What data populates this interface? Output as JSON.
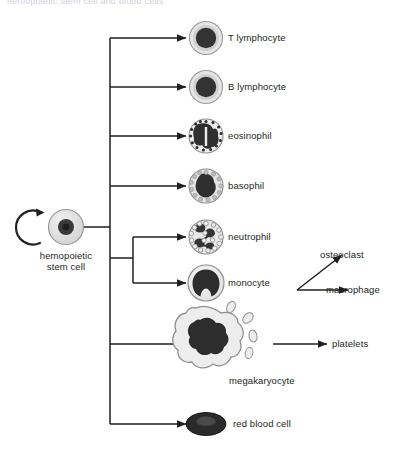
{
  "figure": {
    "clipped_header": "hemopoietic stem cell and blood cells",
    "root": {
      "label_line1": "hemopoietic",
      "label_line2": "stem cell",
      "self_renewal_icon": "self-renewal-arrow-icon"
    },
    "lineages": [
      {
        "id": "t-lymphocyte",
        "label": "T lymphocyte",
        "icon": "t-lymphocyte-cell-icon"
      },
      {
        "id": "b-lymphocyte",
        "label": "B lymphocyte",
        "icon": "b-lymphocyte-cell-icon"
      },
      {
        "id": "eosinophil",
        "label": "eosinophil",
        "icon": "eosinophil-cell-icon"
      },
      {
        "id": "basophil",
        "label": "basophil",
        "icon": "basophil-cell-icon"
      },
      {
        "id": "neutrophil",
        "label": "neutrophil",
        "icon": "neutrophil-cell-icon"
      },
      {
        "id": "monocyte",
        "label": "monocyte",
        "icon": "monocyte-cell-icon"
      },
      {
        "id": "megakaryocyte",
        "label": "megakaryocyte",
        "icon": "megakaryocyte-cell-icon"
      },
      {
        "id": "red-blood-cell",
        "label": "red blood cell",
        "icon": "red-blood-cell-icon"
      }
    ],
    "derived": [
      {
        "id": "osteoclast",
        "label": "osteoclast",
        "from": "monocyte"
      },
      {
        "id": "macrophage",
        "label": "macrophage",
        "from": "monocyte"
      },
      {
        "id": "platelets",
        "label": "platelets",
        "from": "megakaryocyte"
      }
    ],
    "colors": {
      "background": "#ffffff",
      "line": "#231f20",
      "nucleus_dark": "#2b2b2b",
      "cytoplasm_light": "#e8e8e8",
      "cytoplasm_mid": "#cfcfcf",
      "outline": "#8a8a8a",
      "text": "#231f20"
    }
  }
}
